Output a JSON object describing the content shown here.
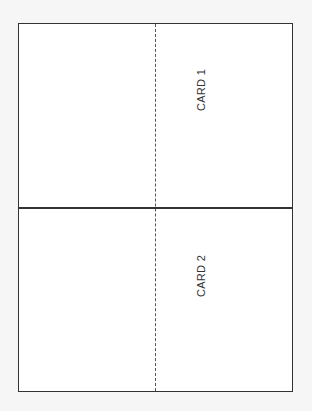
{
  "sheet": {
    "cards": [
      {
        "label": "CARD 1"
      },
      {
        "label": "CARD 2"
      }
    ],
    "colors": {
      "border": "#333333",
      "background": "#ffffff",
      "page": "#f6f6f6"
    }
  }
}
